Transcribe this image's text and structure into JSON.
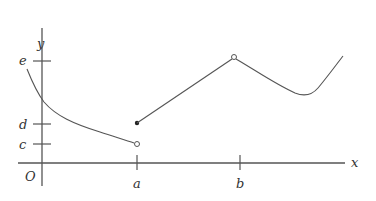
{
  "figure": {
    "type": "piecewise function graph",
    "axes": {
      "x_label": "x",
      "y_label": "y",
      "origin_label": "O"
    },
    "x_ticks": [
      {
        "label": "a",
        "px": 137
      },
      {
        "label": "b",
        "px": 240
      }
    ],
    "y_ticks": [
      {
        "label": "e",
        "py": 61
      },
      {
        "label": "d",
        "py": 124
      },
      {
        "label": "c",
        "py": 144
      }
    ],
    "pieces": [
      {
        "description": "decreasing concave-up curve from upper-left, crossing y-axis between d and e, ending at open circle (a, c)",
        "end_point": {
          "x": "a",
          "y": "c",
          "style": "open"
        }
      },
      {
        "description": "straight line segment from closed dot (a, d) up to open circle near (b, e)",
        "start_point": {
          "x": "a",
          "y": "d",
          "style": "closed"
        },
        "end_point": {
          "x": "b",
          "y": "e",
          "style": "open"
        }
      },
      {
        "description": "curve decreasing from open circle to a local minimum, then increasing to the right"
      }
    ],
    "colors": {
      "stroke": "#555555",
      "axis": "#444444",
      "label": "#333333"
    }
  }
}
